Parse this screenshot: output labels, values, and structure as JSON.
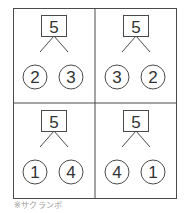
{
  "colors": {
    "stroke": "#4a4a4a",
    "text": "#333333",
    "caption": "#9a9a9a",
    "background": "#ffffff"
  },
  "cells": [
    {
      "whole": "5",
      "left": "2",
      "right": "3"
    },
    {
      "whole": "5",
      "left": "3",
      "right": "2"
    },
    {
      "whole": "5",
      "left": "1",
      "right": "4"
    },
    {
      "whole": "5",
      "left": "4",
      "right": "1"
    }
  ],
  "caption": "※サクランボ"
}
